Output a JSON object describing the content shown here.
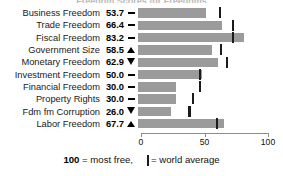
{
  "chart_data": {
    "type": "bar",
    "title": "Freedom Scores for Freedoms",
    "xlabel": "",
    "ylabel": "",
    "xlim": [
      0,
      100
    ],
    "grid": false,
    "legend_position": "bottom",
    "categories": [
      "Business Freedom",
      "Trade Freedom",
      "Fiscal Freedom",
      "Government Size",
      "Monetary Freedom",
      "Investment Freedom",
      "Financial Freedom",
      "Property Rights",
      "Fdm fm Corruption",
      "Labor Freedom"
    ],
    "values": [
      53.7,
      66.4,
      83.2,
      58.5,
      62.9,
      50.0,
      30.0,
      30.0,
      26.0,
      67.7
    ],
    "value_labels": [
      "53.7",
      "66.4",
      "83.2",
      "58.5",
      "62.9",
      "50.0",
      "30.0",
      "30.0",
      "26.0",
      "67.7"
    ],
    "trend_indicators": [
      "dash",
      "dash",
      "dash",
      "up",
      "down",
      "dash",
      "dash",
      "dash",
      "down",
      "up"
    ],
    "world_average": [
      64.3,
      74.5,
      74.9,
      65.0,
      70.2,
      49.0,
      48.5,
      43.6,
      40.5,
      62.1
    ],
    "series": [
      {
        "name": "Country score",
        "values": [
          53.7,
          66.4,
          83.2,
          58.5,
          62.9,
          50.0,
          30.0,
          30.0,
          26.0,
          67.7
        ]
      },
      {
        "name": "World average",
        "values": [
          64.3,
          74.5,
          74.9,
          65.0,
          70.2,
          49.0,
          48.5,
          43.6,
          40.5,
          62.1
        ]
      }
    ],
    "tick_values": [
      0,
      50,
      100
    ],
    "tick_labels": [
      "0",
      "50",
      "100"
    ],
    "colors": {
      "bar": "#9b9b9b",
      "average_marker": "#1b1b1b",
      "axis": "#8d8d8d",
      "text": "#111111"
    }
  },
  "legend": {
    "scale_value": "100",
    "scale_text": "= most free,",
    "marker_text": "= world average"
  }
}
